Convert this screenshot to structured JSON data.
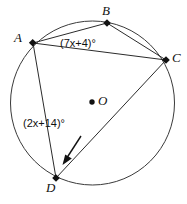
{
  "figure": {
    "shape": "circle",
    "stroke_color": "#3a3a3a",
    "label_color": "#111111",
    "background": "#ffffff"
  },
  "circle": {
    "center_label": "O",
    "center_x": 92.5,
    "center_y": 103,
    "radius": 82
  },
  "points": [
    {
      "label": "A",
      "x": 33,
      "y": 43
    },
    {
      "label": "B",
      "x": 107,
      "y": 23
    },
    {
      "label": "C",
      "x": 166,
      "y": 60
    },
    {
      "label": "D",
      "x": 56,
      "y": 178
    },
    {
      "label": "O",
      "x": 92,
      "y": 102
    }
  ],
  "chords": [
    {
      "name": "chord-AB",
      "from": "A",
      "to": "B"
    },
    {
      "name": "chord-BC",
      "from": "B",
      "to": "C"
    },
    {
      "name": "chord-AC",
      "from": "A",
      "to": "C"
    },
    {
      "name": "chord-AD",
      "from": "A",
      "to": "D"
    },
    {
      "name": "chord-DC",
      "from": "D",
      "to": "C"
    }
  ],
  "angle_labels": {
    "at_b": "(7x+4)°",
    "at_d": "(2x+14)°"
  },
  "annotation": {
    "arrow": "leader-arrow-to-angle-d",
    "arrow_from_x": 81,
    "arrow_from_y": 136,
    "arrow_to_x": 63,
    "arrow_to_y": 164
  }
}
